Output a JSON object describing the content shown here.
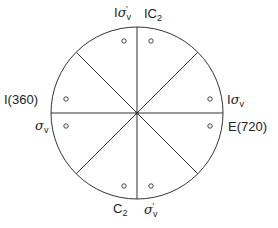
{
  "diagram": {
    "type": "stereographic-projection",
    "colors": {
      "line": "#333333",
      "background": "#ffffff"
    },
    "circle": {
      "cx": 137,
      "cy": 113,
      "r": 86
    },
    "points": [
      {
        "x": 124,
        "y": 41
      },
      {
        "x": 151,
        "y": 41
      },
      {
        "x": 66,
        "y": 99
      },
      {
        "x": 66,
        "y": 126
      },
      {
        "x": 210,
        "y": 99
      },
      {
        "x": 210,
        "y": 126
      },
      {
        "x": 124,
        "y": 186
      },
      {
        "x": 151,
        "y": 186
      }
    ],
    "labels": {
      "top_left": {
        "prefix": "I",
        "symbol": "σ",
        "sub": "v",
        "prime": "′"
      },
      "top_right": {
        "prefix": "IC",
        "sub": "2"
      },
      "left_upper": {
        "text": "I(360)"
      },
      "left_lower": {
        "symbol": "σ",
        "sub": "v"
      },
      "right_upper": {
        "prefix": "I",
        "symbol": "σ",
        "sub": "v"
      },
      "right_lower": {
        "text": "E(720)"
      },
      "bottom_left": {
        "prefix": "C",
        "sub": "2"
      },
      "bottom_right": {
        "symbol": "σ",
        "sub": "v",
        "prime": "′"
      }
    }
  }
}
